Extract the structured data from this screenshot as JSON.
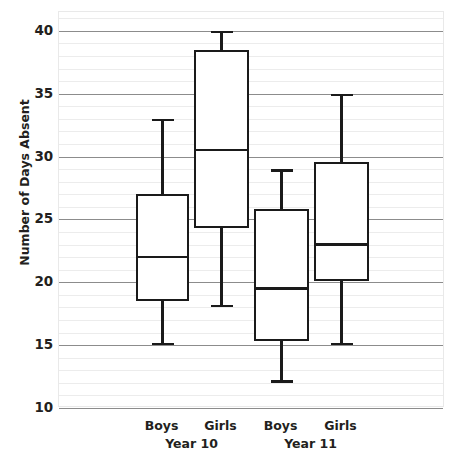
{
  "chart_data": {
    "type": "box",
    "title": "",
    "xlabel": "",
    "ylabel": "Number of Days Absent",
    "ylim": [
      10,
      41.5
    ],
    "yticks": [
      10,
      15,
      20,
      25,
      30,
      35,
      40
    ],
    "ytick_labels": [
      "10",
      "15",
      "20",
      "25",
      "30",
      "35",
      "40"
    ],
    "minor_gridline_step": 1,
    "grid": true,
    "legend": "none",
    "group_labels": [
      "Year 10",
      "Year 11"
    ],
    "categories": [
      "Boys",
      "Girls",
      "Boys",
      "Girls"
    ],
    "boxes": [
      {
        "name": "Year 10 Boys",
        "group": "Year 10",
        "sex": "Boys",
        "min": 15.0,
        "q1": 18.5,
        "median": 22.0,
        "q3": 27.0,
        "max": 33.0
      },
      {
        "name": "Year 10 Girls",
        "group": "Year 10",
        "sex": "Girls",
        "min": 18.0,
        "q1": 24.3,
        "median": 30.5,
        "q3": 38.5,
        "max": 40.0
      },
      {
        "name": "Year 11 Boys",
        "group": "Year 11",
        "sex": "Boys",
        "min": 12.0,
        "q1": 15.3,
        "median": 19.5,
        "q3": 25.8,
        "max": 29.0
      },
      {
        "name": "Year 11 Girls",
        "group": "Year 11",
        "sex": "Girls",
        "min": 15.0,
        "q1": 20.1,
        "median": 23.0,
        "q3": 29.6,
        "max": 35.0
      }
    ],
    "colors": {
      "box_stroke": "#1a1a1a",
      "box_fill": "#ffffff",
      "major_gridline": "#8c8c8c",
      "minor_gridline": "#ececec",
      "text": "#231f20",
      "background": "#ffffff"
    }
  }
}
